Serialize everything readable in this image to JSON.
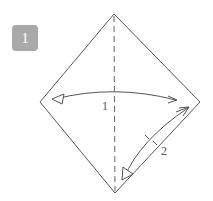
{
  "step": {
    "number": "1",
    "badge_color": "#a9a9a9"
  },
  "diagram": {
    "type": "origami-fold-instruction",
    "shape": "square-rotated-45",
    "line_color": "#555555",
    "crease": "vertical-valley-fold-dashed",
    "labels": [
      {
        "id": "fold-1",
        "text": "1"
      },
      {
        "id": "fold-2",
        "text": "2"
      }
    ]
  }
}
